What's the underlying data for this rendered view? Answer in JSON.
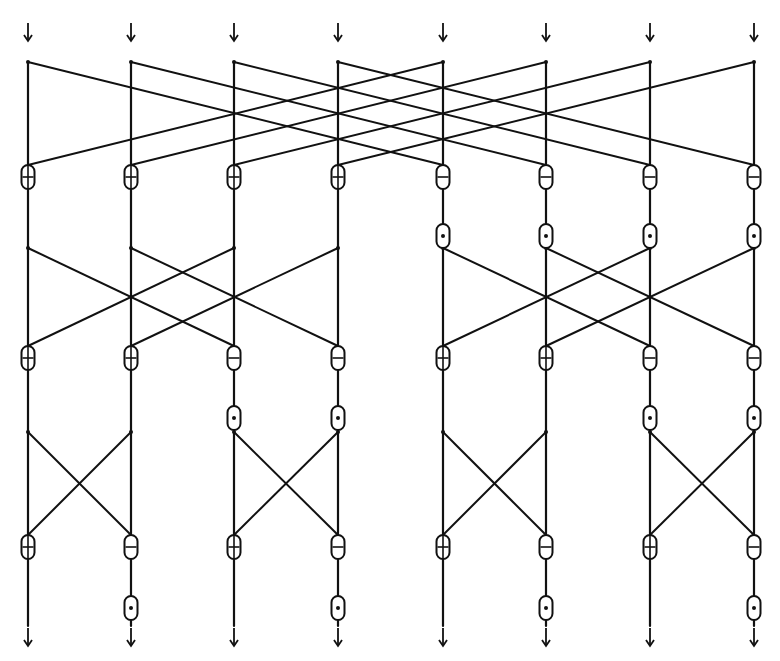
{
  "diagram": {
    "columns": [
      28,
      131,
      234,
      338,
      443,
      546,
      650,
      754
    ],
    "colors": {
      "ink": "#111111",
      "background": "#ffffff"
    },
    "node_types": {
      "add": "⊕",
      "subtract": "⊖",
      "multiply": "⊙"
    },
    "inputs": {
      "arrow_y": 35,
      "count": 8
    },
    "outputs": {
      "arrow_y": 640,
      "count": 8
    },
    "stages": [
      {
        "name": "stage-1",
        "junction_y": 62,
        "node_y": 177,
        "span": 4,
        "ops": [
          "add",
          "add",
          "add",
          "add",
          "subtract",
          "subtract",
          "subtract",
          "subtract"
        ],
        "multiply_y": 236,
        "multiply_cols": [
          4,
          5,
          6,
          7
        ]
      },
      {
        "name": "stage-2",
        "junction_y": 248,
        "node_y": 358,
        "span": 2,
        "ops": [
          "add",
          "add",
          "subtract",
          "subtract",
          "add",
          "add",
          "subtract",
          "subtract"
        ],
        "multiply_y": 418,
        "multiply_cols": [
          2,
          3,
          6,
          7
        ]
      },
      {
        "name": "stage-3",
        "junction_y": 432,
        "node_y": 547,
        "span": 1,
        "ops": [
          "add",
          "subtract",
          "add",
          "subtract",
          "add",
          "subtract",
          "add",
          "subtract"
        ],
        "multiply_y": 608,
        "multiply_cols": [
          1,
          3,
          5,
          7
        ]
      }
    ]
  }
}
